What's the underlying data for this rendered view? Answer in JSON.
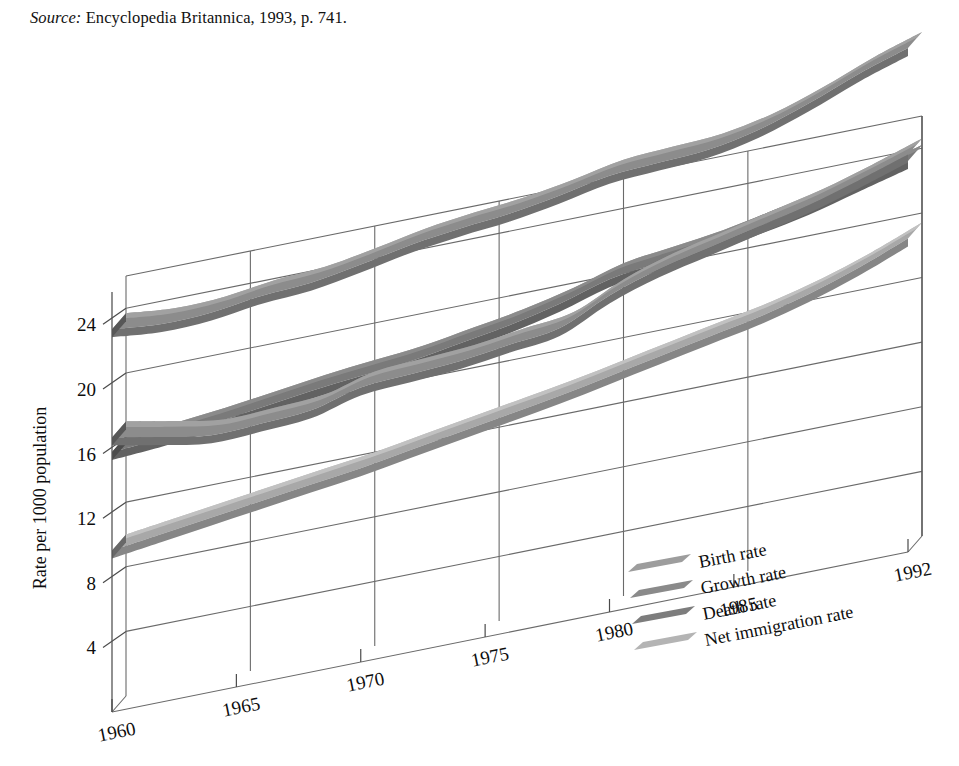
{
  "source": {
    "label": "Source:",
    "text": "Encyclopedia Britannica, 1993, p. 741."
  },
  "chart_data": {
    "type": "line",
    "title": "",
    "subtitle": "",
    "xlabel": "",
    "ylabel": "Rate per 1000 population",
    "grid": true,
    "legend_position": "inside-bottom-right",
    "projection": "3d-ribbon",
    "xlim": [
      1960,
      1992
    ],
    "ylim": [
      0,
      26
    ],
    "yticks": [
      4,
      8,
      12,
      16,
      20,
      24
    ],
    "ytick_labels": [
      "4",
      "8",
      "12",
      "16",
      "20",
      "24"
    ],
    "xticks": [
      1960,
      1965,
      1970,
      1975,
      1980,
      1985,
      1992
    ],
    "xtick_labels": [
      "1960",
      "1965",
      "1970",
      "1975",
      "1980",
      "1985",
      "1992"
    ],
    "x": [
      1960,
      1962,
      1964,
      1966,
      1968,
      1970,
      1972,
      1974,
      1976,
      1978,
      1980,
      1982,
      1984,
      1986,
      1988,
      1990,
      1992
    ],
    "series": [
      {
        "name": "Birth rate",
        "color": "#8c8c8c",
        "values": [
          23.7,
          23.4,
          23.5,
          23.9,
          24.1,
          24.6,
          25.2,
          25.6,
          25.9,
          26.4,
          27.0,
          27.2,
          27.4,
          28.0,
          29.0,
          30.2,
          31.2
        ]
      },
      {
        "name": "Growth rate",
        "color": "#8c8c8c",
        "values": [
          17.0,
          16.4,
          15.9,
          16.0,
          16.2,
          17.0,
          17.2,
          17.4,
          17.8,
          18.2,
          19.6,
          20.6,
          21.3,
          22.0,
          22.7,
          23.6,
          24.6
        ]
      },
      {
        "name": "Death rate",
        "color": "#7a7a7a",
        "values": [
          16.1,
          16.3,
          16.6,
          17.0,
          17.4,
          17.7,
          18.0,
          18.5,
          19.0,
          19.7,
          20.6,
          21.0,
          21.4,
          22.0,
          22.6,
          23.4,
          24.2
        ]
      },
      {
        "name": "Net immigration rate",
        "color": "#a8a8a8",
        "values": [
          10.0,
          10.4,
          10.8,
          11.2,
          11.6,
          12.0,
          12.5,
          13.0,
          13.5,
          14.0,
          14.6,
          15.2,
          15.8,
          16.4,
          17.2,
          18.2,
          19.4
        ]
      }
    ],
    "legend_entries": [
      {
        "label": "Birth rate",
        "color": "#9d9d9d"
      },
      {
        "label": "Growth rate",
        "color": "#8a8a8a"
      },
      {
        "label": "Death rate",
        "color": "#7d7d7d"
      },
      {
        "label": "Net immigration rate",
        "color": "#b4b4b4"
      }
    ]
  }
}
